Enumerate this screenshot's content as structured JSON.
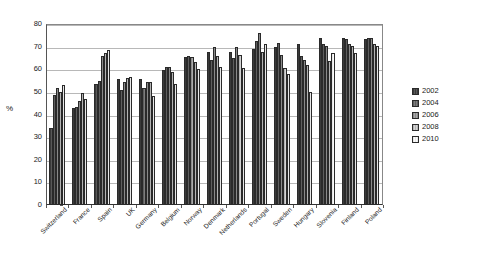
{
  "chart_data": {
    "type": "bar",
    "title": "",
    "subtitle": "",
    "xlabel": "",
    "ylabel": "%",
    "ylim": [
      0,
      80
    ],
    "yticks": [
      0,
      10,
      20,
      30,
      40,
      50,
      60,
      70,
      80
    ],
    "grid": true,
    "legend_position": "right",
    "categories": [
      "Switzerland",
      "France",
      "Spain",
      "UK",
      "Germany",
      "Belgium",
      "Norway",
      "Denmark",
      "Netherlands",
      "Portugal",
      "Sweden",
      "Hungary",
      "Slovenia",
      "Finland",
      "Poland"
    ],
    "series": [
      {
        "name": "2002",
        "values": [
          34,
          43,
          53.5,
          55.5,
          55.5,
          59.5,
          65.5,
          67.5,
          67.5,
          69,
          70,
          71,
          74,
          74,
          73.5
        ]
      },
      {
        "name": "2004",
        "values": [
          48.5,
          43.5,
          55,
          51,
          51.5,
          61,
          66,
          64,
          65,
          72.5,
          71.5,
          66,
          71,
          73.5,
          74
        ]
      },
      {
        "name": "2006",
        "values": [
          51.5,
          46,
          66,
          54.5,
          54.5,
          61,
          65.5,
          70,
          70,
          76,
          66.5,
          64,
          70.5,
          71,
          74
        ]
      },
      {
        "name": "2008",
        "values": [
          50,
          49.5,
          67,
          56,
          54.5,
          59,
          63,
          66,
          66.5,
          67.5,
          60.5,
          62,
          63.5,
          70.5,
          71
        ]
      },
      {
        "name": "2010",
        "values": [
          53,
          47,
          68.5,
          56.5,
          48,
          53.5,
          60,
          61,
          60.5,
          71,
          58,
          50,
          67,
          67,
          70.5
        ]
      }
    ],
    "series_colors": [
      "#4a4a4a",
      "#6e6e6e",
      "#9a9a9a",
      "#c4c4c4",
      "#f2f2f2"
    ]
  }
}
